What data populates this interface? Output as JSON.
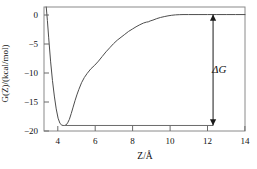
{
  "chart_data": {
    "type": "line",
    "title": "",
    "xlabel": "Z/Å",
    "ylabel": "G(Z)/(kcal/mol)",
    "xlim": [
      3.3,
      14.0
    ],
    "ylim": [
      -20,
      1.3
    ],
    "xticks": [
      4,
      6,
      8,
      10,
      12,
      14
    ],
    "xtick_labels": [
      "4",
      "6",
      "8",
      "10",
      "12",
      "14"
    ],
    "yticks": [
      0,
      -5,
      -10,
      -15,
      -20
    ],
    "ytick_labels": [
      "0",
      "−5",
      "−10",
      "−15",
      "−20"
    ],
    "grid": false,
    "legend": null,
    "line_color": "#4d4d4d",
    "axis_color": "#808080",
    "series": [
      {
        "name": "potential of mean force",
        "x": [
          3.42,
          3.48,
          3.55,
          3.65,
          3.75,
          3.85,
          3.95,
          4.05,
          4.15,
          4.25,
          4.32,
          4.4,
          4.48,
          4.56,
          4.65,
          4.75,
          4.85,
          4.95,
          5.05,
          5.15,
          5.3,
          5.45,
          5.6,
          5.8,
          6.0,
          6.2,
          6.4,
          6.6,
          6.8,
          7.0,
          7.2,
          7.4,
          7.6,
          7.8,
          8.0,
          8.2,
          8.4,
          8.6,
          8.75,
          8.85,
          8.95,
          9.1,
          9.3,
          9.5,
          9.7,
          9.9,
          10.1,
          10.3,
          10.5,
          10.7,
          11.0,
          11.5,
          12.0,
          12.5,
          13.0,
          13.5,
          14.0
        ],
        "y": [
          1.3,
          -1.0,
          -4.0,
          -8.0,
          -11.3,
          -14.0,
          -16.2,
          -17.8,
          -18.7,
          -19.0,
          -19.05,
          -19.05,
          -18.95,
          -18.6,
          -18.0,
          -17.0,
          -15.9,
          -14.8,
          -13.8,
          -12.9,
          -11.7,
          -10.8,
          -10.1,
          -9.3,
          -8.7,
          -8.0,
          -7.2,
          -6.4,
          -5.7,
          -5.0,
          -4.4,
          -3.9,
          -3.4,
          -2.9,
          -2.5,
          -2.1,
          -1.75,
          -1.45,
          -1.3,
          -1.25,
          -1.1,
          -0.95,
          -0.7,
          -0.5,
          -0.35,
          -0.22,
          -0.12,
          -0.05,
          -0.02,
          0.0,
          0.0,
          0.0,
          0.0,
          0.0,
          0.0,
          0.0,
          0.0
        ]
      }
    ],
    "annotations": [
      {
        "name": "delta-g-arrow",
        "label": "ΔG",
        "type": "double-headed-arrow",
        "x": 12.3,
        "y_top": 0,
        "y_bottom": -19.05,
        "value": 19.05
      },
      {
        "name": "minimum-reference-line",
        "type": "horizontal-line",
        "y": -19.05,
        "x_start": 4.4,
        "x_end": 12.3
      }
    ]
  }
}
